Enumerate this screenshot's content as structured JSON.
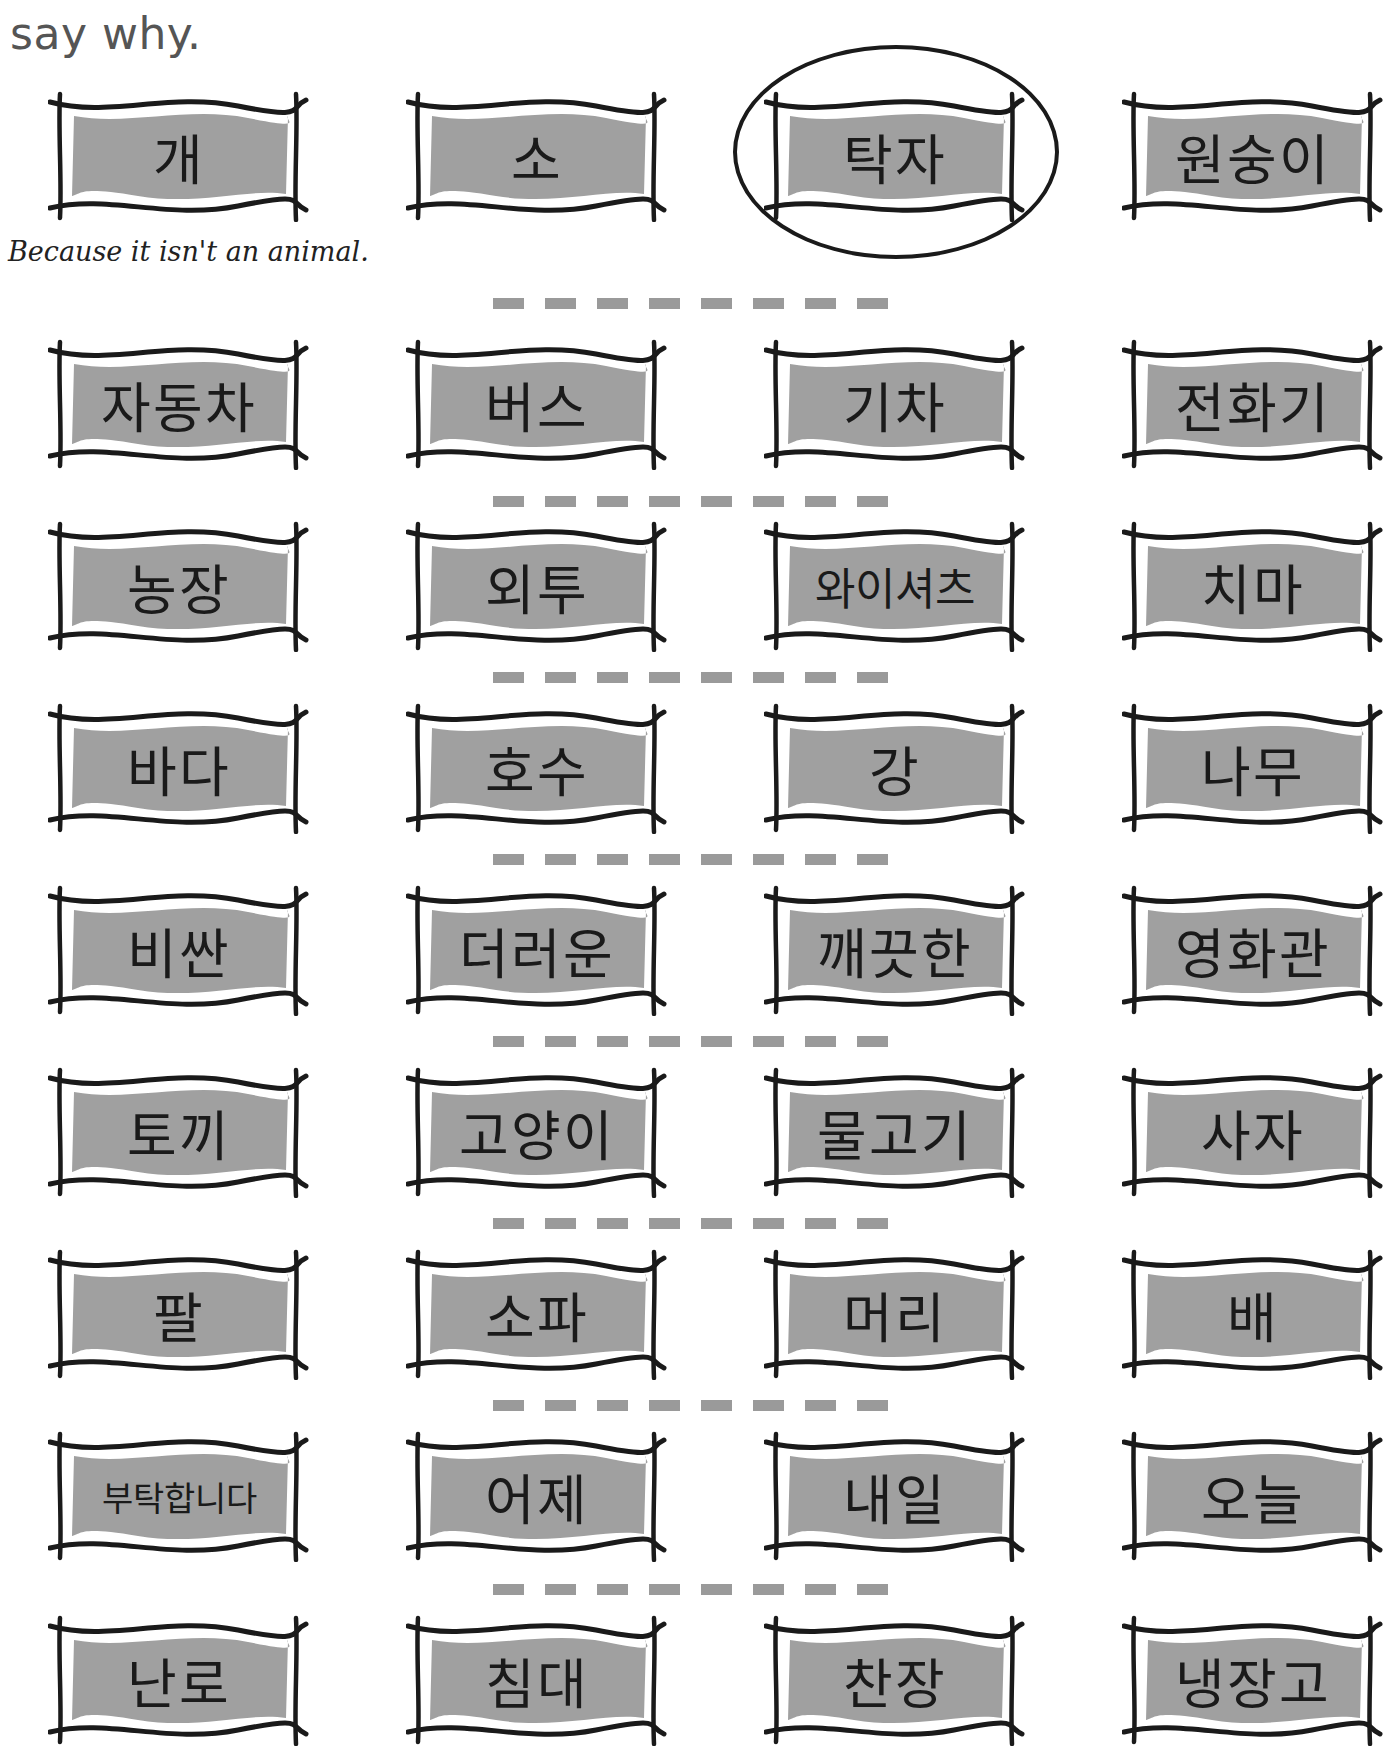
{
  "instruction": "say why.",
  "example": {
    "answer": "Because it isn't an animal.",
    "circled_word": "탁자"
  },
  "colors": {
    "box_fill": "#a0a0a0",
    "box_outline": "#1a1a1a",
    "dash": "#9a9a9a",
    "instruction_text": "#555555"
  },
  "rows": [
    {
      "words": [
        "개",
        "소",
        "탁자",
        "원숭이"
      ]
    },
    {
      "words": [
        "자동차",
        "버스",
        "기차",
        "전화기"
      ]
    },
    {
      "words": [
        "농장",
        "외투",
        "와이셔츠",
        "치마"
      ]
    },
    {
      "words": [
        "바다",
        "호수",
        "강",
        "나무"
      ]
    },
    {
      "words": [
        "비싼",
        "더러운",
        "깨끗한",
        "영화관"
      ]
    },
    {
      "words": [
        "토끼",
        "고양이",
        "물고기",
        "사자"
      ]
    },
    {
      "words": [
        "팔",
        "소파",
        "머리",
        "배"
      ]
    },
    {
      "words": [
        "부탁합니다",
        "어제",
        "내일",
        "오늘"
      ]
    },
    {
      "words": [
        "난로",
        "침대",
        "찬장",
        "냉장고"
      ]
    }
  ]
}
